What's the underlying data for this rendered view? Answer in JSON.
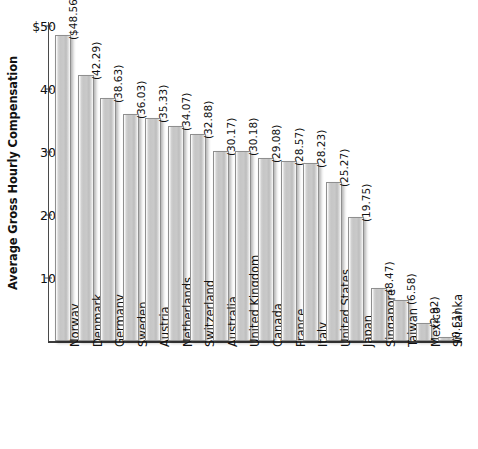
{
  "chart_data": {
    "type": "bar",
    "title": "",
    "subtitle": "",
    "xlabel": "",
    "ylabel": "Average Gross Hourly Compensation",
    "ylim": [
      0,
      50
    ],
    "ytick_labels": [
      "$50",
      "40",
      "30",
      "20",
      "10"
    ],
    "ytick_values": [
      50,
      40,
      30,
      20,
      10
    ],
    "grid": false,
    "legend": null,
    "value_label_format": "(value)",
    "currency_symbol_on_first": true,
    "categories": [
      "Norway",
      "Denmark",
      "Germany",
      "Sweden",
      "Austria",
      "Netherlands",
      "Switzerland",
      "Australia",
      "United Kingdom",
      "Canada",
      "France",
      "Italy",
      "United States",
      "Japan",
      "Singapore",
      "Taiwan",
      "Mexico",
      "Sri Lanka"
    ],
    "values": [
      48.56,
      42.29,
      38.63,
      36.03,
      35.33,
      34.07,
      32.88,
      30.17,
      30.18,
      29.08,
      28.57,
      28.23,
      25.27,
      19.75,
      8.47,
      6.58,
      2.92,
      0.61
    ],
    "value_labels": [
      "($48.56)",
      "(42.29)",
      "(38.63)",
      "(36.03)",
      "(35.33)",
      "(34.07)",
      "(32.88)",
      "(30.17)",
      "(30.18)",
      "(29.08)",
      "(28.57)",
      "(28.23)",
      "(25.27)",
      "(19.75)",
      "(8.47)",
      "(6.58)",
      "(2.92)",
      "(0.61)"
    ],
    "colors": {
      "bar_fill_light": "#fdfdfd",
      "bar_fill_mid": "#c6c6c6",
      "bar_border": "#8f8f8f",
      "axis": "#3c3c3c",
      "text": "#111111",
      "background": "#ffffff"
    }
  }
}
